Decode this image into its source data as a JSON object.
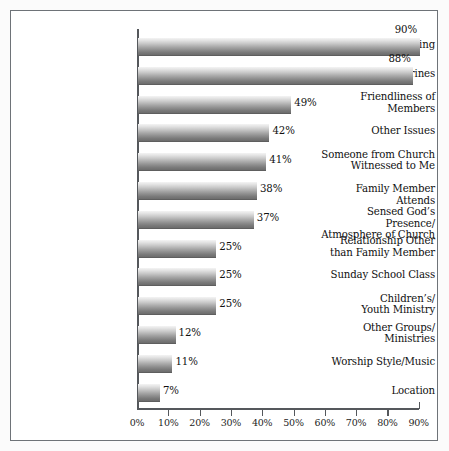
{
  "chart_data": {
    "type": "bar",
    "orientation": "horizontal",
    "title": "",
    "subtitle": "",
    "xlabel": "",
    "ylabel": "",
    "xlim": [
      0,
      90
    ],
    "grid": false,
    "legend": null,
    "xticks": [
      "0%",
      "10%",
      "20%",
      "30%",
      "40%",
      "50%",
      "60%",
      "70%",
      "80%",
      "90%"
    ],
    "xtick_values": [
      0,
      10,
      20,
      30,
      40,
      50,
      60,
      70,
      80,
      90
    ],
    "categories": [
      "Pastor/Preaching",
      "Doctrines",
      "Friendliness of\nMembers",
      "Other Issues",
      "Someone from Church\nWitnessed to Me",
      "Family Member Attends",
      "Sensed God’s Presence/\nAtmosphere of Church",
      "Relationship Other\nthan Family Member",
      "Sunday School Class",
      "Children’s/\nYouth Ministry",
      "Other Groups/\nMinistries",
      "Worship Style/Music",
      "Location"
    ],
    "values": [
      90,
      88,
      49,
      42,
      41,
      38,
      37,
      25,
      25,
      25,
      12,
      11,
      7
    ],
    "value_labels": [
      "90%",
      "88%",
      "49%",
      "42%",
      "41%",
      "38%",
      "37%",
      "25%",
      "25%",
      "25%",
      "12%",
      "11%",
      "7%"
    ]
  },
  "rows": [
    {
      "label_line1": "Pastor/Preaching",
      "label_line2": "",
      "value": 90,
      "value_label": "90%",
      "label_pos": "above"
    },
    {
      "label_line1": "Doctrines",
      "label_line2": "",
      "value": 88,
      "value_label": "88%",
      "label_pos": "above"
    },
    {
      "label_line1": "Friendliness of",
      "label_line2": "Members",
      "value": 49,
      "value_label": "49%",
      "label_pos": "right"
    },
    {
      "label_line1": "Other Issues",
      "label_line2": "",
      "value": 42,
      "value_label": "42%",
      "label_pos": "right"
    },
    {
      "label_line1": "Someone from Church",
      "label_line2": "Witnessed to Me",
      "value": 41,
      "value_label": "41%",
      "label_pos": "right"
    },
    {
      "label_line1": "Family Member Attends",
      "label_line2": "",
      "value": 38,
      "value_label": "38%",
      "label_pos": "right"
    },
    {
      "label_line1": "Sensed God’s Presence/",
      "label_line2": "Atmosphere of Church",
      "value": 37,
      "value_label": "37%",
      "label_pos": "right"
    },
    {
      "label_line1": "Relationship Other",
      "label_line2": "than Family Member",
      "value": 25,
      "value_label": "25%",
      "label_pos": "right"
    },
    {
      "label_line1": "Sunday School Class",
      "label_line2": "",
      "value": 25,
      "value_label": "25%",
      "label_pos": "right"
    },
    {
      "label_line1": "Children’s/",
      "label_line2": "Youth Ministry",
      "value": 25,
      "value_label": "25%",
      "label_pos": "right"
    },
    {
      "label_line1": "Other Groups/",
      "label_line2": "Ministries",
      "value": 12,
      "value_label": "12%",
      "label_pos": "right"
    },
    {
      "label_line1": "Worship Style/Music",
      "label_line2": "",
      "value": 11,
      "value_label": "11%",
      "label_pos": "right"
    },
    {
      "label_line1": "Location",
      "label_line2": "",
      "value": 7,
      "value_label": "7%",
      "label_pos": "right"
    }
  ],
  "style": {
    "frame_color": "#6e7378",
    "axis_color": "#55585c",
    "bar_top_color": "#f4f4f4",
    "bar_bottom_color": "#6c6c6c",
    "text_color": "#101010",
    "background": "#ffffff"
  }
}
